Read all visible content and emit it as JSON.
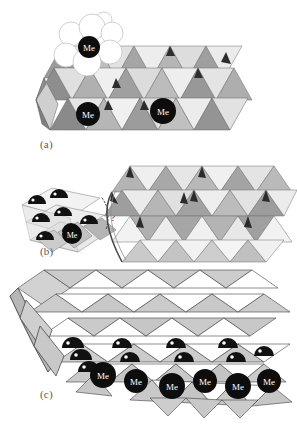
{
  "figure": {
    "type": "crystal-structure-diagram",
    "background_color": "#ffffff",
    "width": 297,
    "height": 446
  },
  "panels": [
    {
      "id": "a",
      "label": "(a)",
      "label_position": {
        "x": 40,
        "y": 138
      },
      "me_labels": [
        "Me",
        "Me",
        "Me"
      ],
      "me_sites": [
        {
          "x": 89,
          "y": 47,
          "r": 11,
          "label": "Me"
        },
        {
          "x": 88,
          "y": 114,
          "r": 12,
          "label": "Me"
        },
        {
          "x": 163,
          "y": 111,
          "r": 13,
          "label": "Me"
        }
      ],
      "sphere_cluster": {
        "count": 7,
        "fill": "#ffffff",
        "stroke": "#b9b9b9",
        "spheres": [
          {
            "x": 71,
            "y": 34,
            "r": 12
          },
          {
            "x": 92,
            "y": 27,
            "r": 13
          },
          {
            "x": 112,
            "y": 33,
            "r": 11
          },
          {
            "x": 66,
            "y": 55,
            "r": 12
          },
          {
            "x": 87,
            "y": 62,
            "r": 14
          },
          {
            "x": 110,
            "y": 52,
            "r": 12
          },
          {
            "x": 104,
            "y": 20,
            "r": 8
          }
        ]
      }
    },
    {
      "id": "b",
      "label": "(b)",
      "label_position": {
        "x": 40,
        "y": 245
      },
      "me_labels": [
        "Me"
      ],
      "question_mark": "?",
      "question_position": {
        "x": 113,
        "y": 217
      },
      "me_sites": [
        {
          "x": 72,
          "y": 234,
          "r": 10,
          "label": "Me"
        }
      ],
      "dome_count": 7
    },
    {
      "id": "c",
      "label": "(c)",
      "label_position": {
        "x": 40,
        "y": 388
      },
      "me_labels": [
        "Me",
        "Me",
        "Me",
        "Me",
        "Me",
        "Me"
      ],
      "me_sites": [
        {
          "x": 103,
          "y": 375,
          "r": 13,
          "label": "Me"
        },
        {
          "x": 136,
          "y": 381,
          "r": 12,
          "label": "Me"
        },
        {
          "x": 172,
          "y": 386,
          "r": 13,
          "label": "Me"
        },
        {
          "x": 205,
          "y": 381,
          "r": 12,
          "label": "Me"
        },
        {
          "x": 238,
          "y": 386,
          "r": 13,
          "label": "Me"
        },
        {
          "x": 267,
          "y": 381,
          "r": 12,
          "label": "Me"
        }
      ],
      "dome_count": 10
    }
  ],
  "colors": {
    "background": "#ffffff",
    "face_light": "#f0f0f0",
    "face_mid_light": "#d9d9d9",
    "face_mid": "#bdbdbd",
    "face_dark": "#9a9a9a",
    "face_darker": "#7d7d7d",
    "edge": "#4a4a4a",
    "edge_light": "#8a8a8a",
    "me_circle": "#0d0d0d",
    "me_label_color": "#ffffff",
    "label_color": "#5a5a5a",
    "sphere_fill": "#ffffff",
    "sphere_stroke": "#b9b9b9",
    "dome_fill": "#111111"
  }
}
